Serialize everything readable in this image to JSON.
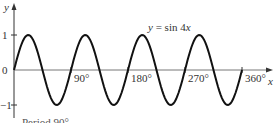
{
  "chart_data": {
    "type": "line",
    "title": "",
    "annotation": "y = sin 4x",
    "xlabel": "x",
    "ylabel": "y",
    "x_ticks": [
      "90°",
      "180°",
      "270°",
      "360°"
    ],
    "y_ticks": [
      "1",
      "0",
      "−1"
    ],
    "xlim": [
      0,
      360
    ],
    "ylim": [
      -1,
      1
    ],
    "grid": false,
    "series": [
      {
        "name": "y = sin 4x",
        "x": [
          0,
          22.5,
          45,
          67.5,
          90,
          112.5,
          135,
          157.5,
          180,
          202.5,
          225,
          247.5,
          270,
          292.5,
          315,
          337.5,
          360
        ],
        "values": [
          0,
          1,
          0,
          -1,
          0,
          1,
          0,
          -1,
          0,
          1,
          0,
          -1,
          0,
          1,
          0,
          -1,
          0
        ]
      }
    ],
    "footer_note": "Period 90°"
  },
  "labels": {
    "y_axis": "y",
    "x_axis": "x",
    "equation": "y = sin 4x",
    "tick_90": "90°",
    "tick_180": "180°",
    "tick_270": "270°",
    "tick_360": "360°",
    "tick_1": "1",
    "tick_0": "0",
    "tick_neg1": "−1",
    "footer": "Period 90°"
  }
}
